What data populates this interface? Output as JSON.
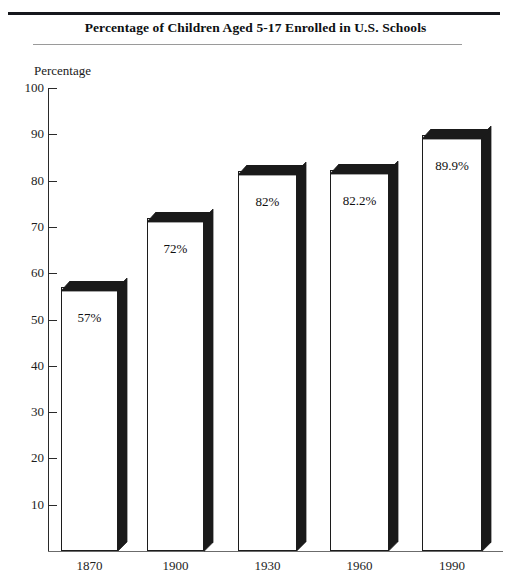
{
  "title": "Percentage of Children Aged 5-17 Enrolled in U.S. Schools",
  "axis": {
    "y_title": "Percentage"
  },
  "chart_data": {
    "type": "bar",
    "title": "Percentage of Children Aged 5-17 Enrolled in U.S. Schools",
    "xlabel": "",
    "ylabel": "Percentage",
    "ylim": [
      0,
      100
    ],
    "ytick_values": [
      100,
      90,
      80,
      70,
      60,
      50,
      40,
      30,
      20,
      10
    ],
    "ytick_labels": [
      "100",
      "90",
      "80",
      "70",
      "60",
      "50",
      "40",
      "30",
      "20",
      "10"
    ],
    "grid": false,
    "legend": "none",
    "style": "3d-extruded-bars",
    "categories": [
      "1870",
      "1900",
      "1930",
      "1960",
      "1990"
    ],
    "values": [
      57,
      72,
      82,
      82.2,
      89.9
    ],
    "data_labels": [
      "57%",
      "72%",
      "82%",
      "82.2%",
      "89.9%"
    ],
    "bar_face_color": "#ffffff",
    "bar_edge_color": "#1c1c1c",
    "bar_depth_color": "#1a1a1a"
  },
  "bars": [
    {
      "category": "1870",
      "value": 57,
      "label": "57%"
    },
    {
      "category": "1900",
      "value": 72,
      "label": "72%"
    },
    {
      "category": "1930",
      "value": 82,
      "label": "82%"
    },
    {
      "category": "1960",
      "value": 82.2,
      "label": "82.2%"
    },
    {
      "category": "1990",
      "value": 89.9,
      "label": "89.9%"
    }
  ],
  "yticks": [
    {
      "value": 100,
      "label": "100"
    },
    {
      "value": 90,
      "label": "90"
    },
    {
      "value": 80,
      "label": "80"
    },
    {
      "value": 70,
      "label": "70"
    },
    {
      "value": 60,
      "label": "60"
    },
    {
      "value": 50,
      "label": "50"
    },
    {
      "value": 40,
      "label": "40"
    },
    {
      "value": 30,
      "label": "30"
    },
    {
      "value": 20,
      "label": "20"
    },
    {
      "value": 10,
      "label": "10"
    }
  ]
}
